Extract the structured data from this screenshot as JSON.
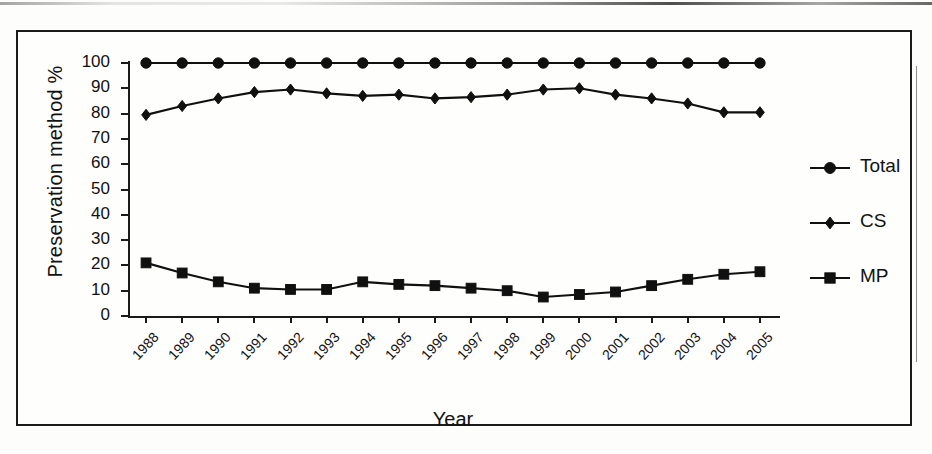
{
  "chart_data": {
    "type": "line",
    "title": "",
    "xlabel": "Year",
    "ylabel": "Preservation method %",
    "ylim": [
      0,
      100
    ],
    "ytick_step": 10,
    "yticks": [
      0,
      10,
      20,
      30,
      40,
      50,
      60,
      70,
      80,
      90,
      100
    ],
    "grid": false,
    "legend_position": "right",
    "categories": [
      "1988",
      "1989",
      "1990",
      "1991",
      "1992",
      "1993",
      "1994",
      "1995",
      "1996",
      "1997",
      "1998",
      "1999",
      "2000",
      "2001",
      "2002",
      "2003",
      "2004",
      "2005"
    ],
    "series": [
      {
        "name": "Total",
        "marker": "circle",
        "color": "#101010",
        "values": [
          100,
          100,
          100,
          100,
          100,
          100,
          100,
          100,
          100,
          100,
          100,
          100,
          100,
          100,
          100,
          100,
          100,
          100
        ]
      },
      {
        "name": "CS",
        "marker": "diamond",
        "color": "#101010",
        "values": [
          79.5,
          83,
          86,
          88.5,
          89.5,
          88,
          87,
          87.5,
          86,
          86.5,
          87.5,
          89.5,
          90,
          87.5,
          86,
          84,
          80.5,
          80.5
        ]
      },
      {
        "name": "MP",
        "marker": "square",
        "color": "#101010",
        "values": [
          21,
          17,
          13.5,
          11,
          10.5,
          10.5,
          13.5,
          12.5,
          12,
          11,
          10,
          7.5,
          8.5,
          9.5,
          12,
          14.5,
          16.5,
          17.5
        ]
      }
    ]
  },
  "axis": {
    "y_title": "Preservation method %",
    "x_title": "Year",
    "y_tick_labels": [
      "100",
      "90",
      "80",
      "70",
      "60",
      "50",
      "40",
      "30",
      "20",
      "10",
      "0"
    ],
    "x_tick_labels": [
      "1988",
      "1989",
      "1990",
      "1991",
      "1992",
      "1993",
      "1994",
      "1995",
      "1996",
      "1997",
      "1998",
      "1999",
      "2000",
      "2001",
      "2002",
      "2003",
      "2004",
      "2005"
    ]
  },
  "legend": {
    "entries": [
      {
        "label": "Total",
        "marker": "circle"
      },
      {
        "label": "CS",
        "marker": "diamond"
      },
      {
        "label": "MP",
        "marker": "square"
      }
    ]
  }
}
